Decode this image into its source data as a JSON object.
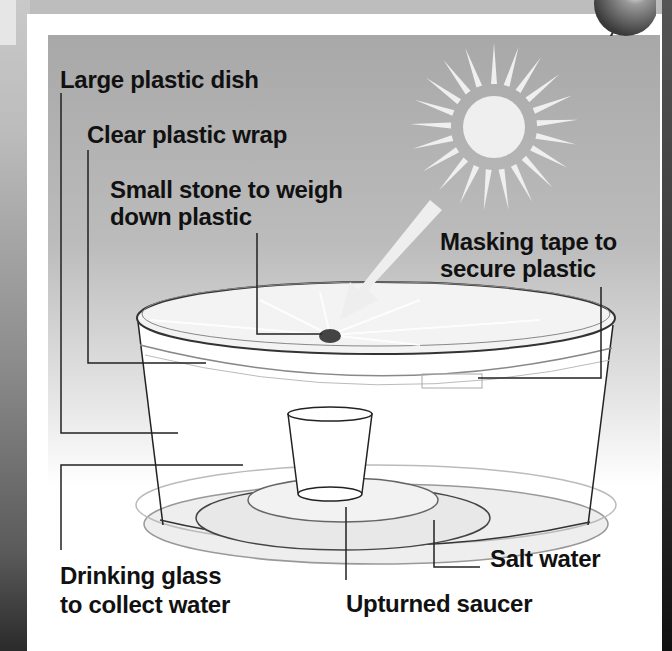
{
  "diagram": {
    "labels": {
      "large_dish": "Large plastic dish",
      "plastic_wrap": "Clear plastic wrap",
      "stone_line1": "Small stone to weigh",
      "stone_line2": "down plastic",
      "tape_line1": "Masking tape to",
      "tape_line2": "secure plastic",
      "glass_line1": "Drinking glass",
      "glass_line2": "to collect water",
      "salt_water": "Salt water",
      "saucer": "Upturned saucer"
    },
    "colors": {
      "panel_top": "#a8a8a8",
      "panel_bottom": "#ffffff",
      "text": "#111111",
      "sun": "#eeeeee",
      "leader_line": "#222222"
    },
    "icons": [
      "sun-icon",
      "arrow-icon",
      "pushpin-icon",
      "stone-icon"
    ]
  }
}
